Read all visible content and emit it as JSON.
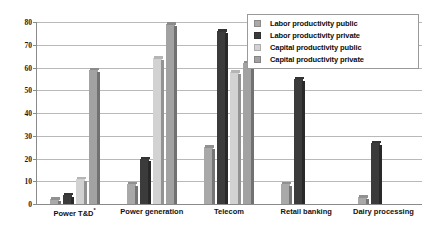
{
  "chart_data": {
    "type": "bar",
    "title": "",
    "subtitle": "",
    "xlabel": "",
    "ylabel": "",
    "ylim": [
      0,
      80
    ],
    "yticks": [
      0,
      10,
      20,
      30,
      40,
      50,
      60,
      70,
      80
    ],
    "grid": true,
    "legend_position": "top-right",
    "categories": [
      "Power T&D*",
      "Power generation",
      "Telecom",
      "Retail banking",
      "Dairy processing"
    ],
    "series": [
      {
        "name": "Labor productivity public",
        "color": "#a9a9a9",
        "values": [
          2,
          9,
          25,
          9,
          3
        ]
      },
      {
        "name": "Labor productivity private",
        "color": "#3b3b3b",
        "values": [
          4,
          20,
          76,
          55,
          27
        ]
      },
      {
        "name": "Capital productivity public",
        "color": "#d2d2d2",
        "values": [
          11,
          64,
          58,
          0,
          0
        ]
      },
      {
        "name": "Capital productivity private",
        "color": "#a2a2a2",
        "values": [
          59,
          79,
          62,
          0,
          0
        ]
      }
    ]
  },
  "axis": {
    "ytick_labels": [
      "80",
      "70",
      "60",
      "50",
      "40",
      "30",
      "20",
      "10",
      "0"
    ]
  },
  "legend": {
    "items": [
      {
        "label": "Labor productivity public",
        "color": "#a9a9a9"
      },
      {
        "label": "Labor productivity private",
        "color": "#3b3b3b"
      },
      {
        "label": "Capital productivity public",
        "color": "#d2d2d2"
      },
      {
        "label": "Capital productivity private",
        "color": "#a2a2a2"
      }
    ]
  },
  "colors": {
    "background": "#ffffff",
    "gridline": "#b9b9b9",
    "axis": "#8a8a8a",
    "text": "#111111"
  }
}
